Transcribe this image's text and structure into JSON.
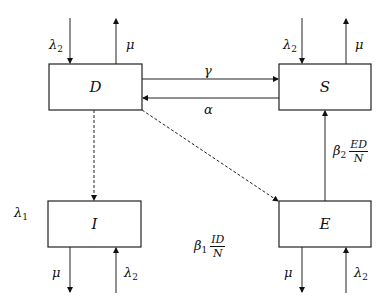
{
  "diagram": {
    "type": "compartmental-model",
    "nodes": [
      {
        "id": "D",
        "label": "D"
      },
      {
        "id": "S",
        "label": "S"
      },
      {
        "id": "I",
        "label": "I"
      },
      {
        "id": "E",
        "label": "E"
      }
    ],
    "edges": [
      {
        "from": "D",
        "to": "S",
        "label": "γ",
        "style": "solid"
      },
      {
        "from": "S",
        "to": "D",
        "label": "α",
        "style": "solid"
      },
      {
        "from": "D",
        "to": "I",
        "label": "",
        "style": "dashed"
      },
      {
        "from": "D",
        "to": "E",
        "label": "β1 ID/N",
        "style": "dashed"
      },
      {
        "from": "E",
        "to": "S",
        "label": "β2 ED/N",
        "style": "solid"
      }
    ],
    "labels": {
      "gamma": "γ",
      "alpha": "α",
      "lambda": "λ",
      "mu": "μ",
      "beta": "β",
      "sub1": "1",
      "sub2": "2",
      "frac_num_ID": "ID",
      "frac_num_ED": "ED",
      "frac_den": "N"
    }
  }
}
